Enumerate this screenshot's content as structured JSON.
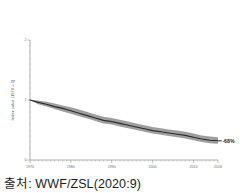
{
  "caption": {
    "text": "출처: WWF/ZSL(2020:9)"
  },
  "chart_data": {
    "type": "line",
    "title": "",
    "xlabel": "",
    "ylabel": "Index value (1970 = 1)",
    "xlim": [
      1970,
      2016
    ],
    "ylim": [
      0,
      2
    ],
    "grid": false,
    "legend": null,
    "xticks": [
      1970,
      1980,
      1990,
      2000,
      2010,
      2016
    ],
    "xtick_labels": [
      "1970",
      "1980",
      "1990",
      "2000",
      "2010",
      "2016"
    ],
    "yticks": [
      0,
      1,
      2
    ],
    "ytick_labels": [
      "0",
      "1",
      "2"
    ],
    "annotations": [
      {
        "text": "-68%",
        "x": 2016,
        "y": 0.32
      }
    ],
    "x": [
      1970,
      1972,
      1974,
      1976,
      1978,
      1980,
      1982,
      1984,
      1986,
      1988,
      1990,
      1992,
      1994,
      1996,
      1998,
      2000,
      2002,
      2004,
      2006,
      2008,
      2010,
      2012,
      2014,
      2016
    ],
    "series": [
      {
        "name": "Living Planet Index",
        "values": [
          1.0,
          0.96,
          0.93,
          0.89,
          0.86,
          0.82,
          0.78,
          0.74,
          0.7,
          0.66,
          0.64,
          0.61,
          0.58,
          0.55,
          0.52,
          0.49,
          0.47,
          0.45,
          0.43,
          0.41,
          0.38,
          0.35,
          0.33,
          0.32
        ]
      },
      {
        "name": "Confidence interval upper",
        "values": [
          1.0,
          0.99,
          0.97,
          0.94,
          0.91,
          0.88,
          0.84,
          0.8,
          0.76,
          0.72,
          0.7,
          0.67,
          0.64,
          0.61,
          0.58,
          0.55,
          0.53,
          0.51,
          0.49,
          0.47,
          0.44,
          0.41,
          0.39,
          0.38
        ]
      },
      {
        "name": "Confidence interval lower",
        "values": [
          1.0,
          0.93,
          0.89,
          0.85,
          0.81,
          0.77,
          0.73,
          0.69,
          0.65,
          0.61,
          0.59,
          0.56,
          0.53,
          0.5,
          0.47,
          0.44,
          0.42,
          0.4,
          0.38,
          0.36,
          0.33,
          0.3,
          0.28,
          0.27
        ]
      }
    ]
  }
}
